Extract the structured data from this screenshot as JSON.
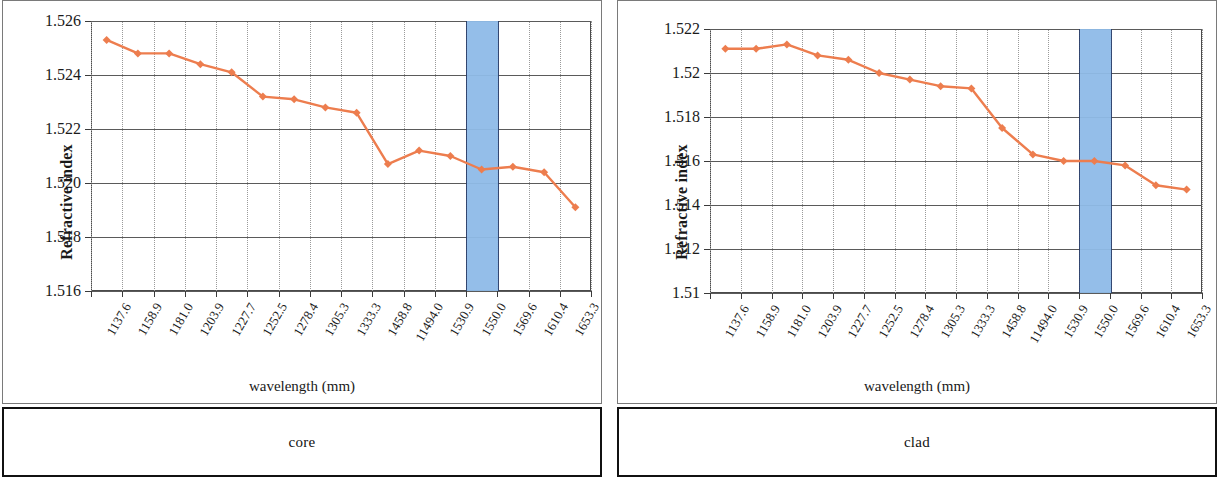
{
  "figure": {
    "panels": [
      {
        "key": "core",
        "caption": "core",
        "xlabel": "wavelength (mm)",
        "ylabel": "Refractive index"
      },
      {
        "key": "clad",
        "caption": "clad",
        "xlabel": "wavelength (mm)",
        "ylabel": "Refractive index"
      }
    ],
    "marker_color": "#ED7D4E",
    "line_color": "#ED7D4E",
    "band_color": "#8fbbe8",
    "band_border_color": "#2b3f6b",
    "band_center_label": "1550.0"
  },
  "chart_data": [
    {
      "type": "line",
      "title": "core",
      "xlabel": "wavelength (mm)",
      "ylabel": "Refractive index",
      "categories": [
        "1137.6",
        "1158.9",
        "1181.0",
        "1203.9",
        "1227.7",
        "1252.5",
        "1278.4",
        "1305.3",
        "1333.3",
        "1458.8",
        "11494.0",
        "1530.9",
        "1550.0",
        "1569.6",
        "1610.4",
        "1653.3"
      ],
      "ytick_labels": [
        "1.526",
        "1.524",
        "1.522",
        "1.520",
        "1.518",
        "1.516"
      ],
      "ylim": [
        1.516,
        1.526
      ],
      "ytick_step": 0.002,
      "grid": true,
      "legend": "none",
      "highlight_band": {
        "category": "1550.0",
        "color": "#8fbbe8"
      },
      "values": [
        1.5253,
        1.5248,
        1.5248,
        1.5244,
        1.5241,
        1.5232,
        1.5231,
        1.5228,
        1.5226,
        1.5207,
        1.5212,
        1.521,
        1.5205,
        1.5206,
        1.5204,
        1.5191
      ]
    },
    {
      "type": "line",
      "title": "clad",
      "xlabel": "wavelength (mm)",
      "ylabel": "Refractive index",
      "categories": [
        "1137.6",
        "1158.9",
        "1181.0",
        "1203.9",
        "1227.7",
        "1252.5",
        "1278.4",
        "1305.3",
        "1333.3",
        "1458.8",
        "11494.0",
        "1530.9",
        "1550.0",
        "1569.6",
        "1610.4",
        "1653.3"
      ],
      "ytick_labels": [
        "1.522",
        "1.52",
        "1.518",
        "1.516",
        "1.514",
        "1.512",
        "1.51"
      ],
      "ylim": [
        1.51,
        1.522
      ],
      "ytick_step": 0.002,
      "grid": true,
      "legend": "none",
      "highlight_band": {
        "category": "1550.0",
        "color": "#8fbbe8"
      },
      "values": [
        1.5211,
        1.5211,
        1.5213,
        1.5208,
        1.5206,
        1.52,
        1.5197,
        1.5194,
        1.5193,
        1.5175,
        1.5163,
        1.516,
        1.516,
        1.5158,
        1.5149,
        1.5147
      ]
    }
  ]
}
